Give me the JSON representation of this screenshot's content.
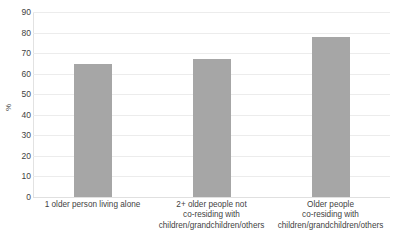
{
  "chart_data": {
    "type": "bar",
    "title": "",
    "subtitle": "",
    "xlabel": "",
    "ylabel": "%",
    "ylim": [
      0,
      90
    ],
    "yticks": [
      0,
      10,
      20,
      30,
      40,
      50,
      60,
      70,
      80,
      90
    ],
    "ytick_labels": [
      "0",
      "10",
      "20",
      "30",
      "40",
      "50",
      "60",
      "70",
      "80",
      "90"
    ],
    "grid": true,
    "legend": false,
    "legend_position": "none",
    "bar_color": "#a6a6a6",
    "gridline_color": "#ececec",
    "text_color": "#3f3f3f",
    "categories": [
      "1 older person living alone",
      "2+ older people not co-residing with children/grandchildren/others",
      "Older people co-residing with children/grandchildren/others"
    ],
    "category_lines": [
      [
        "1 older person living alone"
      ],
      [
        "2+ older people not",
        "co-residing with",
        "children/grandchildren/others"
      ],
      [
        "Older people",
        "co-residing with",
        "children/grandchildren/others"
      ]
    ],
    "values": [
      64.5,
      67,
      78
    ]
  }
}
